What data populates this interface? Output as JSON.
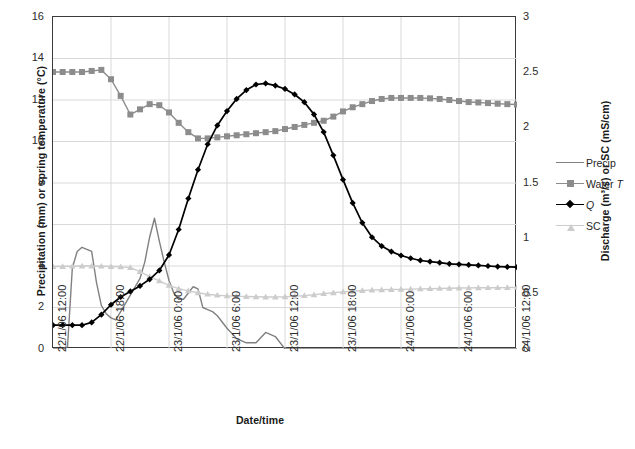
{
  "chart_data": {
    "type": "line",
    "title": "",
    "xlabel": "Date/time",
    "ylabel": "Precipitation (mm) or spring temperature (°C)",
    "y2label": "Discharge (m³/s) or SC (mS/cm)",
    "ylim": [
      0,
      16
    ],
    "y2lim": [
      0,
      3
    ],
    "grid": true,
    "legend_position": "right",
    "x_tick_labels": [
      "22/1/06 12:00",
      "22/1/06 18:00",
      "23/1/06 0:00",
      "23/1/06 6:00",
      "23/1/06 12:00",
      "23/1/06 18:00",
      "24/1/06 0:00",
      "24/1/06 6:00",
      "24/1/06 12:00"
    ],
    "y_tick_labels": [
      "0",
      "2",
      "4",
      "6",
      "8",
      "10",
      "12",
      "14",
      "16"
    ],
    "y2_tick_labels": [
      "0",
      "0.5",
      "1",
      "1.5",
      "2",
      "2.5",
      "3"
    ],
    "x_hours_range": [
      0,
      48
    ],
    "series": [
      {
        "name": "Precip",
        "axis": "left",
        "color": "#808080",
        "marker": "none",
        "units": "mm",
        "x": [
          0,
          0.5,
          1,
          1.5,
          2,
          2.5,
          3,
          3.5,
          4,
          4.5,
          5,
          5.5,
          6,
          6.5,
          7,
          7.5,
          8,
          8.5,
          9,
          9.5,
          10,
          10.5,
          11,
          11.5,
          12,
          12.5,
          13,
          13.5,
          14,
          14.5,
          15,
          15.5,
          16,
          16.5,
          17,
          17.5,
          18,
          19,
          20,
          21,
          22,
          23,
          24,
          26,
          28,
          30,
          32,
          34,
          36,
          38,
          40,
          42,
          44,
          46,
          48
        ],
        "values": [
          0,
          0,
          0,
          0.1,
          3.9,
          4.7,
          4.9,
          4.8,
          4.7,
          3.2,
          2.1,
          1.7,
          1.5,
          1.4,
          1.8,
          2.2,
          2.6,
          3.0,
          3.4,
          4.2,
          5.4,
          6.3,
          5.2,
          4.2,
          3.3,
          2.7,
          2.4,
          2.4,
          2.7,
          3.0,
          2.9,
          2.0,
          1.9,
          1.8,
          1.6,
          1.3,
          1.0,
          0.5,
          0.3,
          0.3,
          0.8,
          0.6,
          0.0,
          0,
          0,
          0,
          0,
          0,
          0,
          0,
          0,
          0,
          0,
          0,
          0
        ]
      },
      {
        "name": "Water T",
        "axis": "left",
        "color": "#8c8c8c",
        "marker": "square",
        "units": "°C",
        "x": [
          0,
          1,
          2,
          3,
          4,
          5,
          6,
          7,
          8,
          9,
          10,
          11,
          12,
          13,
          14,
          15,
          16,
          17,
          18,
          19,
          20,
          21,
          22,
          23,
          24,
          25,
          26,
          27,
          28,
          29,
          30,
          31,
          32,
          33,
          34,
          35,
          36,
          37,
          38,
          39,
          40,
          41,
          42,
          43,
          44,
          45,
          46,
          47,
          48
        ],
        "values": [
          13.35,
          13.35,
          13.35,
          13.35,
          13.4,
          13.45,
          13.0,
          12.2,
          11.3,
          11.55,
          11.8,
          11.75,
          11.4,
          10.9,
          10.45,
          10.15,
          10.15,
          10.2,
          10.25,
          10.3,
          10.35,
          10.4,
          10.45,
          10.5,
          10.6,
          10.7,
          10.8,
          10.9,
          11.0,
          11.2,
          11.45,
          11.65,
          11.8,
          11.95,
          12.05,
          12.1,
          12.1,
          12.1,
          12.1,
          12.08,
          12.05,
          12.0,
          11.95,
          11.9,
          11.88,
          11.85,
          11.82,
          11.8,
          11.78
        ]
      },
      {
        "name": "Q",
        "axis": "right",
        "color": "#000000",
        "marker": "diamond",
        "units": "m³/s",
        "x": [
          0,
          1,
          2,
          3,
          4,
          5,
          6,
          7,
          8,
          9,
          10,
          11,
          12,
          13,
          14,
          15,
          16,
          17,
          18,
          19,
          20,
          21,
          22,
          23,
          24,
          25,
          26,
          27,
          28,
          29,
          30,
          31,
          32,
          33,
          34,
          35,
          36,
          37,
          38,
          39,
          40,
          41,
          42,
          43,
          44,
          45,
          46,
          47,
          48
        ],
        "values": [
          0.215,
          0.215,
          0.215,
          0.215,
          0.24,
          0.31,
          0.4,
          0.47,
          0.52,
          0.57,
          0.63,
          0.71,
          0.85,
          1.08,
          1.36,
          1.62,
          1.85,
          2.02,
          2.15,
          2.26,
          2.34,
          2.39,
          2.4,
          2.38,
          2.35,
          2.3,
          2.23,
          2.12,
          1.96,
          1.75,
          1.53,
          1.32,
          1.14,
          1.01,
          0.93,
          0.88,
          0.845,
          0.82,
          0.8,
          0.79,
          0.78,
          0.77,
          0.765,
          0.76,
          0.755,
          0.75,
          0.745,
          0.742,
          0.74
        ]
      },
      {
        "name": "SC",
        "axis": "right",
        "color": "#cccccc",
        "marker": "triangle",
        "units": "mS/cm",
        "x": [
          0,
          1,
          2,
          3,
          4,
          5,
          6,
          7,
          8,
          9,
          10,
          11,
          12,
          13,
          14,
          15,
          16,
          17,
          18,
          19,
          20,
          21,
          22,
          23,
          24,
          25,
          26,
          27,
          28,
          29,
          30,
          31,
          32,
          33,
          34,
          35,
          36,
          37,
          38,
          39,
          40,
          41,
          42,
          43,
          44,
          45,
          46,
          47,
          48
        ],
        "values": [
          0.745,
          0.745,
          0.748,
          0.75,
          0.75,
          0.748,
          0.745,
          0.742,
          0.735,
          0.7,
          0.655,
          0.615,
          0.575,
          0.545,
          0.525,
          0.508,
          0.495,
          0.486,
          0.48,
          0.476,
          0.474,
          0.472,
          0.47,
          0.47,
          0.472,
          0.476,
          0.482,
          0.49,
          0.5,
          0.508,
          0.516,
          0.522,
          0.528,
          0.532,
          0.535,
          0.537,
          0.539,
          0.541,
          0.543,
          0.545,
          0.547,
          0.549,
          0.551,
          0.552,
          0.553,
          0.554,
          0.554,
          0.555,
          0.556
        ]
      }
    ]
  },
  "legend": {
    "items": [
      {
        "label": "Precip",
        "label_italic": ""
      },
      {
        "label": "Water ",
        "label_italic": "T"
      },
      {
        "label": "",
        "label_italic": "Q"
      },
      {
        "label": "SC",
        "label_italic": ""
      }
    ]
  }
}
